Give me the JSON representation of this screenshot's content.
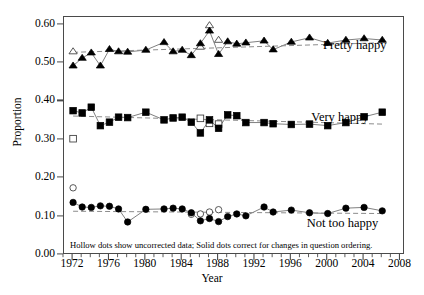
{
  "chart_data": {
    "type": "line",
    "title": "",
    "xlabel": "Year",
    "ylabel": "Proportion",
    "xlim": [
      1971,
      2008.5
    ],
    "ylim": [
      0.0,
      0.62
    ],
    "grid": false,
    "legend_position": "inline-right",
    "y_ticks": [
      "0.00",
      "0.10",
      "0.20",
      "0.30",
      "0.40",
      "0.50",
      "0.60"
    ],
    "y_tick_values": [
      0.0,
      0.1,
      0.2,
      0.3,
      0.4,
      0.5,
      0.6
    ],
    "x_ticks": [
      "1972",
      "1976",
      "1980",
      "1984",
      "1988",
      "1992",
      "1996",
      "2000",
      "2004",
      "2008"
    ],
    "x_tick_values": [
      1972,
      1976,
      1980,
      1984,
      1988,
      1992,
      1996,
      2000,
      2004,
      2008
    ],
    "x_minor_step": 1,
    "annotation": "Hollow dots show uncorrected data; Solid dots correct for changes in question ordering.",
    "series": [
      {
        "name": "Pretty happy",
        "marker": "triangle",
        "label_x": 1999.6,
        "label_y": 0.545,
        "x": [
          1972,
          1973,
          1974,
          1975,
          1976,
          1977,
          1978,
          1980,
          1982,
          1983,
          1984,
          1985,
          1986,
          1987,
          1988,
          1989,
          1990,
          1991,
          1993,
          1994,
          1996,
          1998,
          2000,
          2002,
          2004,
          2006
        ],
        "values": [
          0.493,
          0.513,
          0.527,
          0.493,
          0.536,
          0.53,
          0.529,
          0.534,
          0.554,
          0.53,
          0.534,
          0.52,
          0.551,
          0.584,
          0.523,
          0.556,
          0.55,
          0.553,
          0.558,
          0.535,
          0.555,
          0.566,
          0.552,
          0.56,
          0.564,
          0.56
        ],
        "hollow_x": [
          1972,
          1986,
          1987,
          1988
        ],
        "hollow_values": [
          0.53,
          0.542,
          0.598,
          0.56
        ],
        "trend": [
          [
            1972,
            0.528
          ],
          [
            2006,
            0.553
          ]
        ]
      },
      {
        "name": "Very happy",
        "marker": "square",
        "label_x": 1998.3,
        "label_y": 0.358,
        "x": [
          1972,
          1973,
          1974,
          1975,
          1976,
          1977,
          1978,
          1980,
          1982,
          1983,
          1984,
          1985,
          1986,
          1987,
          1988,
          1989,
          1990,
          1991,
          1993,
          1994,
          1996,
          1998,
          2000,
          2002,
          2004,
          2006
        ],
        "values": [
          0.376,
          0.37,
          0.385,
          0.337,
          0.346,
          0.359,
          0.358,
          0.372,
          0.352,
          0.357,
          0.359,
          0.346,
          0.318,
          0.352,
          0.33,
          0.365,
          0.363,
          0.345,
          0.345,
          0.342,
          0.34,
          0.341,
          0.337,
          0.345,
          0.36,
          0.372
        ],
        "hollow_x": [
          1972,
          1986,
          1987,
          1988
        ],
        "hollow_values": [
          0.303,
          0.356,
          0.343,
          0.341
        ],
        "trend": [
          [
            1972,
            0.362
          ],
          [
            2006,
            0.341
          ]
        ]
      },
      {
        "name": "Not too happy",
        "marker": "circle",
        "label_x": 1997.8,
        "label_y": 0.082,
        "x": [
          1972,
          1973,
          1974,
          1975,
          1976,
          1977,
          1978,
          1980,
          1982,
          1983,
          1984,
          1985,
          1986,
          1987,
          1988,
          1989,
          1990,
          1991,
          1993,
          1994,
          1996,
          1998,
          2000,
          2002,
          2004,
          2006
        ],
        "values": [
          0.137,
          0.125,
          0.124,
          0.128,
          0.127,
          0.12,
          0.086,
          0.119,
          0.12,
          0.122,
          0.12,
          0.11,
          0.089,
          0.095,
          0.087,
          0.1,
          0.107,
          0.102,
          0.125,
          0.112,
          0.117,
          0.11,
          0.108,
          0.122,
          0.124,
          0.115
        ],
        "hollow_x": [
          1972,
          1985,
          1986,
          1987,
          1988
        ],
        "hollow_values": [
          0.175,
          0.106,
          0.107,
          0.112,
          0.118
        ],
        "trend": [
          [
            1972,
            0.114
          ],
          [
            2006,
            0.108
          ]
        ]
      }
    ]
  },
  "axis": {
    "y_title": "Proportion",
    "x_title": "Year"
  },
  "colors": {
    "marker": "#000000",
    "line": "#555555",
    "trend": "#8c8c8c",
    "frame": "#4a4a4a"
  }
}
